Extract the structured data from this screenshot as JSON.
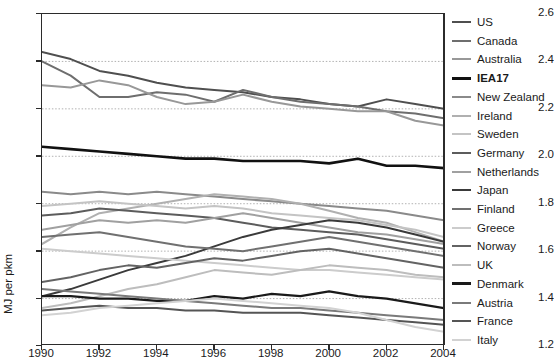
{
  "chart": {
    "title": "",
    "ylabel": "MJ per pkm",
    "xlabel": ""
  },
  "chart_data": {
    "type": "line",
    "title": "",
    "xlabel": "",
    "ylabel": "MJ per pkm",
    "xlim": [
      1990,
      2004
    ],
    "ylim": [
      1.2,
      2.6
    ],
    "grid": "horizontal-dotted",
    "legend_position": "right",
    "xticks": [
      1990,
      1992,
      1994,
      1996,
      1998,
      2000,
      2002,
      2004
    ],
    "yticks": [
      1.2,
      1.4,
      1.6,
      1.8,
      2.0,
      2.2,
      2.4,
      2.6
    ],
    "x": [
      1990,
      1991,
      1992,
      1993,
      1994,
      1995,
      1996,
      1997,
      1998,
      1999,
      2000,
      2001,
      2002,
      2003,
      2004
    ],
    "series": [
      {
        "name": "US",
        "color": "#4f4f4f",
        "width": 2.0,
        "values": [
          2.44,
          2.41,
          2.36,
          2.34,
          2.31,
          2.29,
          2.28,
          2.27,
          2.25,
          2.24,
          2.22,
          2.21,
          2.24,
          2.22,
          2.2
        ]
      },
      {
        "name": "Canada",
        "color": "#6e6e6e",
        "width": 2.0,
        "values": [
          2.4,
          2.34,
          2.25,
          2.25,
          2.27,
          2.26,
          2.23,
          2.28,
          2.25,
          2.23,
          2.22,
          2.21,
          2.19,
          2.18,
          2.16
        ]
      },
      {
        "name": "Australia",
        "color": "#989898",
        "width": 2.0,
        "values": [
          2.3,
          2.29,
          2.32,
          2.3,
          2.25,
          2.22,
          2.23,
          2.26,
          2.23,
          2.21,
          2.2,
          2.19,
          2.19,
          2.15,
          2.13
        ]
      },
      {
        "name": "IEA17",
        "color": "#111111",
        "width": 2.6,
        "values": [
          2.04,
          2.03,
          2.02,
          2.01,
          2.0,
          1.99,
          1.99,
          1.98,
          1.98,
          1.98,
          1.97,
          1.99,
          1.96,
          1.96,
          1.95
        ]
      },
      {
        "name": "New Zealand",
        "color": "#8a8a8a",
        "width": 2.0,
        "values": [
          1.85,
          1.84,
          1.85,
          1.84,
          1.85,
          1.84,
          1.83,
          1.82,
          1.81,
          1.8,
          1.79,
          1.78,
          1.77,
          1.75,
          1.73
        ]
      },
      {
        "name": "Ireland",
        "color": "#b0b0b0",
        "width": 2.0,
        "values": [
          1.63,
          1.7,
          1.76,
          1.78,
          1.8,
          1.82,
          1.84,
          1.83,
          1.82,
          1.8,
          1.77,
          1.74,
          1.72,
          1.68,
          1.64
        ]
      },
      {
        "name": "Sweden",
        "color": "#c4c4c4",
        "width": 2.0,
        "values": [
          1.79,
          1.8,
          1.81,
          1.8,
          1.79,
          1.78,
          1.79,
          1.78,
          1.76,
          1.75,
          1.74,
          1.73,
          1.71,
          1.69,
          1.66
        ]
      },
      {
        "name": "Germany",
        "color": "#5c5c5c",
        "width": 2.0,
        "values": [
          1.75,
          1.76,
          1.78,
          1.77,
          1.76,
          1.75,
          1.74,
          1.72,
          1.7,
          1.69,
          1.68,
          1.67,
          1.65,
          1.63,
          1.61
        ]
      },
      {
        "name": "Netherlands",
        "color": "#a0a0a0",
        "width": 2.0,
        "values": [
          1.69,
          1.71,
          1.73,
          1.72,
          1.73,
          1.72,
          1.74,
          1.76,
          1.74,
          1.72,
          1.7,
          1.68,
          1.67,
          1.65,
          1.63
        ]
      },
      {
        "name": "Japan",
        "color": "#3a3a3a",
        "width": 2.0,
        "values": [
          1.41,
          1.44,
          1.48,
          1.52,
          1.55,
          1.58,
          1.62,
          1.66,
          1.69,
          1.71,
          1.73,
          1.72,
          1.7,
          1.67,
          1.64
        ]
      },
      {
        "name": "Finland",
        "color": "#707070",
        "width": 2.0,
        "values": [
          1.66,
          1.67,
          1.68,
          1.66,
          1.64,
          1.62,
          1.61,
          1.6,
          1.62,
          1.64,
          1.66,
          1.64,
          1.62,
          1.6,
          1.58
        ]
      },
      {
        "name": "Greece",
        "color": "#cccccc",
        "width": 2.0,
        "values": [
          1.61,
          1.6,
          1.59,
          1.58,
          1.57,
          1.56,
          1.55,
          1.54,
          1.53,
          1.52,
          1.52,
          1.51,
          1.5,
          1.49,
          1.48
        ]
      },
      {
        "name": "Norway",
        "color": "#636363",
        "width": 2.0,
        "values": [
          1.47,
          1.49,
          1.52,
          1.54,
          1.53,
          1.55,
          1.57,
          1.56,
          1.58,
          1.6,
          1.61,
          1.59,
          1.57,
          1.55,
          1.53
        ]
      },
      {
        "name": "UK",
        "color": "#bdbdbd",
        "width": 2.0,
        "values": [
          1.36,
          1.38,
          1.41,
          1.44,
          1.46,
          1.49,
          1.52,
          1.51,
          1.5,
          1.52,
          1.54,
          1.53,
          1.52,
          1.5,
          1.49
        ]
      },
      {
        "name": "Denmark",
        "color": "#1a1a1a",
        "width": 2.2,
        "values": [
          1.41,
          1.41,
          1.4,
          1.4,
          1.39,
          1.39,
          1.41,
          1.4,
          1.42,
          1.41,
          1.43,
          1.41,
          1.4,
          1.38,
          1.36
        ]
      },
      {
        "name": "Austria",
        "color": "#7a7a7a",
        "width": 2.0,
        "values": [
          1.44,
          1.43,
          1.42,
          1.41,
          1.4,
          1.39,
          1.38,
          1.37,
          1.36,
          1.36,
          1.35,
          1.34,
          1.33,
          1.32,
          1.31
        ]
      },
      {
        "name": "France",
        "color": "#555555",
        "width": 2.0,
        "values": [
          1.35,
          1.36,
          1.37,
          1.36,
          1.36,
          1.35,
          1.35,
          1.34,
          1.34,
          1.34,
          1.33,
          1.32,
          1.31,
          1.3,
          1.29
        ]
      },
      {
        "name": "Italy",
        "color": "#d2d2d2",
        "width": 2.0,
        "values": [
          1.33,
          1.34,
          1.36,
          1.37,
          1.38,
          1.39,
          1.4,
          1.39,
          1.38,
          1.37,
          1.36,
          1.34,
          1.31,
          1.28,
          1.26
        ]
      }
    ]
  },
  "legend": {
    "items": [
      {
        "label": "US"
      },
      {
        "label": "Canada"
      },
      {
        "label": "Australia"
      },
      {
        "label": "IEA17"
      },
      {
        "label": "New Zealand"
      },
      {
        "label": "Ireland"
      },
      {
        "label": "Sweden"
      },
      {
        "label": "Germany"
      },
      {
        "label": "Netherlands"
      },
      {
        "label": "Japan"
      },
      {
        "label": "Finland"
      },
      {
        "label": "Greece"
      },
      {
        "label": "Norway"
      },
      {
        "label": "UK"
      },
      {
        "label": "Denmark"
      },
      {
        "label": "Austria"
      },
      {
        "label": "France"
      },
      {
        "label": "Italy"
      }
    ]
  }
}
